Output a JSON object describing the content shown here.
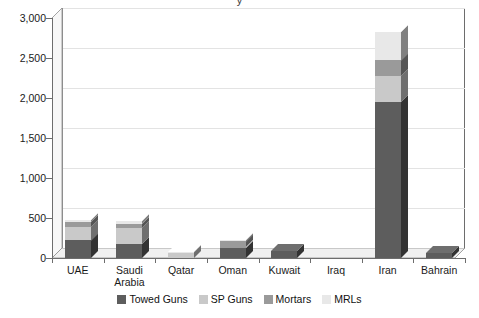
{
  "title_partial": "y",
  "chart_data": {
    "type": "bar",
    "subtype": "stacked-column-3d",
    "title": "",
    "xlabel": "",
    "ylabel": "",
    "ylim": [
      0,
      3000
    ],
    "ytick_values": [
      0,
      500,
      1000,
      1500,
      2000,
      2500,
      3000
    ],
    "ytick_labels": [
      "0",
      "500",
      "1,000",
      "1,500",
      "2,000",
      "2,500",
      "3,000"
    ],
    "grid": true,
    "legend_position": "bottom",
    "categories": [
      "UAE",
      "Saudi\nArabia",
      "Qatar",
      "Oman",
      "Kuwait",
      "Iraq",
      "Iran",
      "Bahrain"
    ],
    "series": [
      {
        "name": "Towed Guns",
        "color": "#5d5d5d",
        "values": [
          220,
          170,
          0,
          130,
          90,
          0,
          1950,
          60
        ]
      },
      {
        "name": "SP Guns",
        "color": "#c9c9c9",
        "values": [
          170,
          200,
          70,
          0,
          0,
          0,
          320,
          0
        ]
      },
      {
        "name": "Mortars",
        "color": "#9a9a9a",
        "values": [
          60,
          50,
          0,
          80,
          0,
          0,
          200,
          0
        ]
      },
      {
        "name": "MRLs",
        "color": "#e8e8e8",
        "values": [
          20,
          40,
          10,
          20,
          0,
          0,
          360,
          0
        ]
      }
    ],
    "totals": [
      470,
      460,
      80,
      230,
      90,
      0,
      2830,
      60
    ]
  },
  "legend": {
    "items": [
      {
        "label": "Towed Guns",
        "color": "#5d5d5d"
      },
      {
        "label": "SP Guns",
        "color": "#c9c9c9"
      },
      {
        "label": "Mortars",
        "color": "#9a9a9a"
      },
      {
        "label": "MRLs",
        "color": "#e8e8e8"
      }
    ]
  },
  "colors": {
    "axis": "#6d6d6d",
    "grid": "#e3e3e3",
    "floor": "#f0f0f0",
    "side_wall": "#f7f7f7",
    "text": "#1a1a1a",
    "background": "#ffffff"
  }
}
